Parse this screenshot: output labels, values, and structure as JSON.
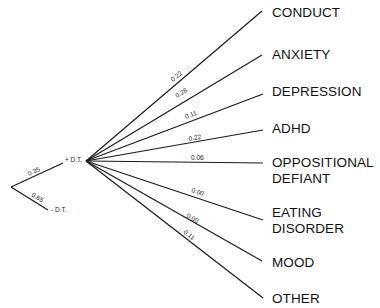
{
  "diagram": {
    "type": "decision-tree",
    "root": {
      "branches": [
        {
          "label": "+ D.T.",
          "probability": "0.35"
        },
        {
          "label": "- D.T.",
          "probability": "0.65"
        }
      ]
    },
    "outcomes_from": "+ D.T.",
    "outcomes": [
      {
        "label": "CONDUCT",
        "probability": "0.22"
      },
      {
        "label": "ANXIETY",
        "probability": "0.28"
      },
      {
        "label": "DEPRESSION",
        "probability": "0.11"
      },
      {
        "label": "ADHD",
        "probability": "0.22"
      },
      {
        "label": "OPPOSITIONAL DEFIANT",
        "line1": "OPPOSITIONAL",
        "line2": "DEFIANT",
        "probability": "0.06"
      },
      {
        "label": "EATING DISORDER",
        "line1": "EATING",
        "line2": "DISORDER",
        "probability": "0.00"
      },
      {
        "label": "MOOD",
        "probability": "0.00"
      },
      {
        "label": "OTHER",
        "probability": "0.11"
      }
    ]
  }
}
